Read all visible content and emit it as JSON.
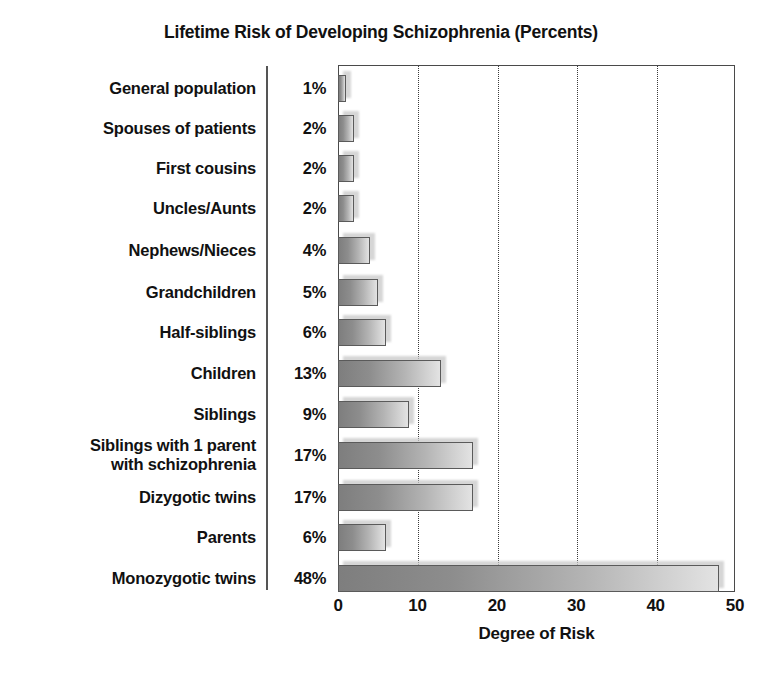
{
  "chart_data": {
    "type": "bar",
    "orientation": "horizontal",
    "title": "Lifetime Risk of Developing Schizophrenia (Percents)",
    "xlabel": "Degree of Risk",
    "ylabel": "",
    "xlim": [
      0,
      50
    ],
    "xticks": [
      "0",
      "10",
      "20",
      "30",
      "40",
      "50"
    ],
    "gridlines": [
      10,
      20,
      30,
      40
    ],
    "grid": true,
    "legend": false,
    "categories": [
      "General population",
      "Spouses of patients",
      "First cousins",
      "Uncles/Aunts",
      "Nephews/Nieces",
      "Grandchildren",
      "Half-siblings",
      "Children",
      "Siblings",
      "Siblings with 1 parent\nwith schizophrenia",
      "Dizygotic twins",
      "Parents",
      "Monozygotic twins"
    ],
    "values": [
      1,
      2,
      2,
      2,
      4,
      5,
      6,
      13,
      9,
      17,
      17,
      6,
      48
    ],
    "value_labels": [
      "1%",
      "2%",
      "2%",
      "2%",
      "4%",
      "5%",
      "6%",
      "13%",
      "9%",
      "17%",
      "17%",
      "6%",
      "48%"
    ],
    "bar_color_start": "#7e7e7e",
    "bar_color_end": "#e3e3e3",
    "bar_border_color": "#5a5a5a",
    "frame_color": "#4a4a4a",
    "text_color": "#111111"
  }
}
